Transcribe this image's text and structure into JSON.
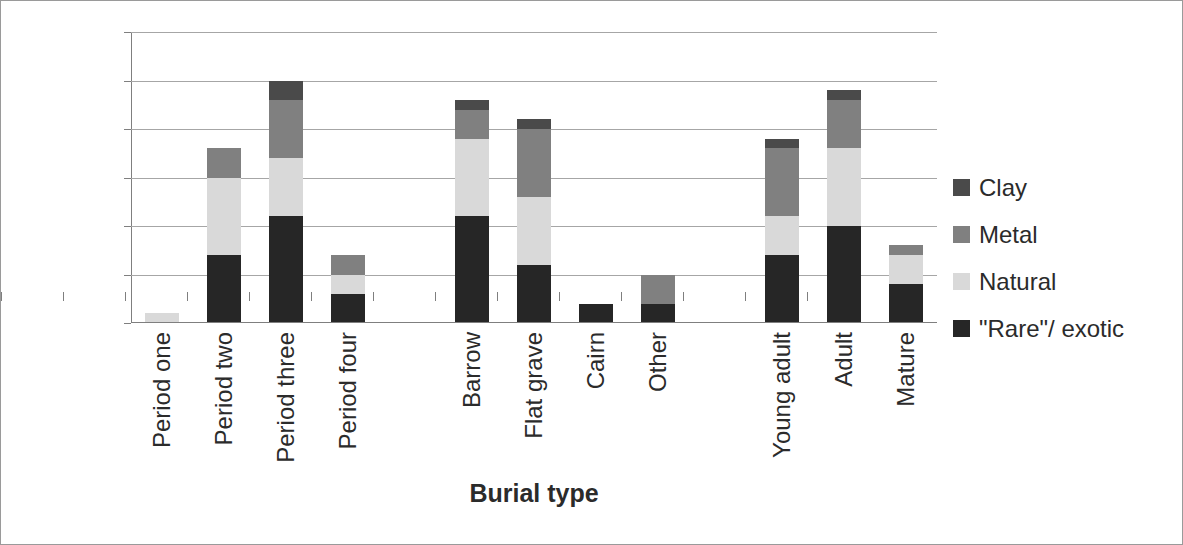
{
  "chart_data": {
    "type": "bar",
    "subtype": "stacked-bar",
    "title": "",
    "xlabel": "Burial type",
    "ylabel": "Number of burials",
    "ylim": [
      0,
      30
    ],
    "ytick_values": [
      0,
      5,
      10,
      15,
      20,
      25,
      30
    ],
    "ytick_labels": [
      "0",
      "5",
      "10",
      "15",
      "20",
      "25",
      "30"
    ],
    "grid": true,
    "grid_axis": "y",
    "legend_position": "right",
    "categories": [
      "Period one",
      "Period two",
      "Period three",
      "Period four",
      "",
      "Barrow",
      "Flat grave",
      "Cairn",
      "Other",
      "",
      "Young adult",
      "Adult",
      "Mature"
    ],
    "stack_order_bottom_to_top": [
      "\"Rare\"/ exotic",
      "Natural",
      "Metal",
      "Clay"
    ],
    "series": [
      {
        "name": "\"Rare\"/ exotic",
        "color": "#262626",
        "values": [
          0,
          7,
          11,
          3,
          0,
          11,
          6,
          2,
          2,
          0,
          7,
          10,
          4
        ]
      },
      {
        "name": "Natural",
        "color": "#d9d9d9",
        "values": [
          1,
          8,
          6,
          2,
          0,
          8,
          7,
          0,
          0,
          0,
          4,
          8,
          3
        ]
      },
      {
        "name": "Metal",
        "color": "#808080",
        "values": [
          0,
          3,
          6,
          2,
          0,
          3,
          7,
          0,
          3,
          0,
          7,
          5,
          1
        ]
      },
      {
        "name": "Clay",
        "color": "#4a4a4a",
        "values": [
          0,
          0,
          2,
          0,
          0,
          1,
          1,
          0,
          0,
          0,
          1,
          1,
          0
        ]
      }
    ],
    "totals": [
      1,
      18,
      25,
      7,
      0,
      23,
      21,
      2,
      5,
      0,
      19,
      24,
      8
    ]
  },
  "legend": {
    "items": [
      {
        "label": "Clay",
        "color": "#4a4a4a"
      },
      {
        "label": "Metal",
        "color": "#808080"
      },
      {
        "label": "Natural",
        "color": "#d9d9d9"
      },
      {
        "label": "\"Rare\"/ exotic",
        "color": "#262626"
      }
    ]
  }
}
